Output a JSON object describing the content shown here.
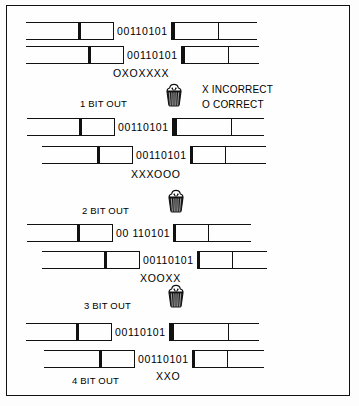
{
  "figure": {
    "legend": {
      "incorrect_label": "X INCORRECT",
      "correct_label": "O CORRECT",
      "icon": "cupcake-icon"
    },
    "colors": {
      "ink": "#111111",
      "paper": "#fefefe"
    },
    "groups": [
      {
        "id": "group-1",
        "bit_label": "1 BIT OUT",
        "pattern": "OXOXXXX",
        "rows": [
          {
            "id": "g1-row-1",
            "left_tail": 52,
            "left_cells": 3,
            "code": "00110101",
            "right_cells": 4,
            "right_tail": 38
          },
          {
            "id": "g1-row-2",
            "left_tail": 62,
            "left_cells": 3,
            "code": "00110101",
            "right_cells": 4,
            "right_tail": 30
          }
        ]
      },
      {
        "id": "group-2",
        "bit_label": "2 BIT OUT",
        "pattern": "XXXOOO",
        "rows": [
          {
            "id": "g2-row-1",
            "left_tail": 52,
            "left_cells": 3,
            "code": "00110101",
            "right_cells": 5,
            "right_tail": 32
          },
          {
            "id": "g2-row-2",
            "left_tail": 55,
            "left_cells": 3,
            "code": "00110101",
            "right_cells": 3,
            "right_tail": 40
          }
        ]
      },
      {
        "id": "group-3",
        "bit_label": "3 BIT OUT",
        "pattern": "XOOXX",
        "rows": [
          {
            "id": "g3-row-1",
            "left_tail": 50,
            "left_cells": 3,
            "code": "00 110101",
            "right_cells": 3,
            "right_tail": 42
          },
          {
            "id": "g3-row-2",
            "left_tail": 62,
            "left_cells": 3,
            "code": "00110101",
            "right_cells": 3,
            "right_tail": 34
          }
        ]
      },
      {
        "id": "group-4",
        "bit_label": "4 BIT OUT",
        "pattern": "XXO",
        "rows": [
          {
            "id": "g4-row-1",
            "left_tail": 50,
            "left_cells": 3,
            "code": "00110101",
            "right_cells": 5,
            "right_tail": 30
          },
          {
            "id": "g4-row-2",
            "left_tail": 55,
            "left_cells": 3,
            "code": "00110101",
            "right_cells": 3,
            "right_tail": 36
          }
        ]
      }
    ]
  }
}
